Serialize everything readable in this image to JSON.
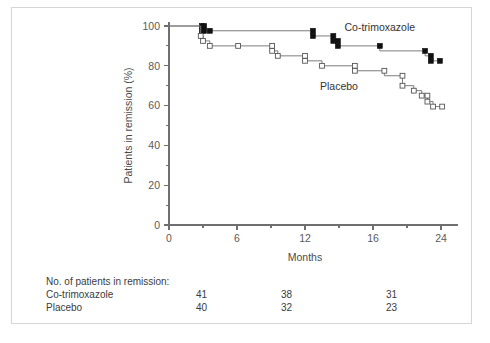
{
  "figure": {
    "background_color": "#ffffff",
    "frame_color": "#d6d6d6",
    "line_color": "#7d7d7d",
    "cotrimoxazole_marker_color": "#111111",
    "placebo_marker_color": "#ffffff",
    "placebo_marker_edge_color": "#555555"
  },
  "chart_data": {
    "type": "line",
    "title": "",
    "subtitle": "",
    "xlabel": "Months",
    "ylabel": "Patients in remission (%)",
    "xlim": [
      0,
      25.5
    ],
    "ylim": [
      0,
      100
    ],
    "xticks": [
      0,
      6,
      12,
      18,
      24
    ],
    "xtick_labels": [
      "0",
      "6",
      "12",
      "16",
      "24"
    ],
    "xminor_ticks": [
      3,
      9,
      15,
      21
    ],
    "yticks": [
      0,
      20,
      40,
      60,
      80,
      100
    ],
    "ytick_labels": [
      "0",
      "20",
      "40",
      "60",
      "80",
      "100"
    ],
    "yminor_ticks": [
      10,
      30,
      50,
      70,
      90
    ],
    "grid": false,
    "legend_position": "inline-annotation",
    "legend": [
      "Co-trimoxazole",
      "Placebo"
    ],
    "annotations": [
      {
        "text": "Co-trimoxazole",
        "x": 18.6,
        "y": 97.5
      },
      {
        "text": "Placebo",
        "x": 15.0,
        "y": 68.0
      }
    ],
    "series": [
      {
        "name": "Co-trimoxazole",
        "marker": "filled-square",
        "step": "post",
        "points": [
          {
            "x": 0.0,
            "y": 100.0
          },
          {
            "x": 2.9,
            "y": 100.0
          },
          {
            "x": 2.9,
            "y": 97.6
          },
          {
            "x": 3.1,
            "y": 97.6
          },
          {
            "x": 3.1,
            "y": 97.6
          },
          {
            "x": 3.6,
            "y": 97.6
          },
          {
            "x": 3.6,
            "y": 97.6
          },
          {
            "x": 12.7,
            "y": 97.6
          },
          {
            "x": 12.7,
            "y": 95.0
          },
          {
            "x": 14.5,
            "y": 95.0
          },
          {
            "x": 14.5,
            "y": 92.5
          },
          {
            "x": 14.9,
            "y": 92.5
          },
          {
            "x": 14.9,
            "y": 90.0
          },
          {
            "x": 18.6,
            "y": 90.0
          },
          {
            "x": 18.6,
            "y": 87.5
          },
          {
            "x": 22.6,
            "y": 87.5
          },
          {
            "x": 22.6,
            "y": 85.0
          },
          {
            "x": 23.1,
            "y": 85.0
          },
          {
            "x": 23.1,
            "y": 82.5
          },
          {
            "x": 23.9,
            "y": 82.5
          }
        ],
        "markers": [
          {
            "x": 2.9,
            "y": 100.0
          },
          {
            "x": 2.9,
            "y": 97.6
          },
          {
            "x": 3.1,
            "y": 100.0
          },
          {
            "x": 3.1,
            "y": 97.6
          },
          {
            "x": 3.6,
            "y": 97.6
          },
          {
            "x": 12.7,
            "y": 97.6
          },
          {
            "x": 12.7,
            "y": 95.0
          },
          {
            "x": 14.5,
            "y": 95.0
          },
          {
            "x": 14.5,
            "y": 92.5
          },
          {
            "x": 14.9,
            "y": 92.5
          },
          {
            "x": 14.9,
            "y": 90.0
          },
          {
            "x": 18.6,
            "y": 90.0
          },
          {
            "x": 22.6,
            "y": 87.5
          },
          {
            "x": 23.1,
            "y": 85.0
          },
          {
            "x": 23.1,
            "y": 82.5
          },
          {
            "x": 23.9,
            "y": 82.5
          }
        ]
      },
      {
        "name": "Placebo",
        "marker": "open-square",
        "step": "post",
        "points": [
          {
            "x": 0.0,
            "y": 100.0
          },
          {
            "x": 2.8,
            "y": 100.0
          },
          {
            "x": 2.8,
            "y": 95.0
          },
          {
            "x": 3.0,
            "y": 95.0
          },
          {
            "x": 3.0,
            "y": 92.5
          },
          {
            "x": 3.6,
            "y": 92.5
          },
          {
            "x": 3.6,
            "y": 90.0
          },
          {
            "x": 6.1,
            "y": 90.0
          },
          {
            "x": 6.1,
            "y": 90.0
          },
          {
            "x": 9.1,
            "y": 90.0
          },
          {
            "x": 9.1,
            "y": 87.5
          },
          {
            "x": 9.6,
            "y": 87.5
          },
          {
            "x": 9.6,
            "y": 85.0
          },
          {
            "x": 12.0,
            "y": 85.0
          },
          {
            "x": 12.0,
            "y": 82.5
          },
          {
            "x": 13.5,
            "y": 82.5
          },
          {
            "x": 13.5,
            "y": 80.0
          },
          {
            "x": 16.4,
            "y": 80.0
          },
          {
            "x": 16.4,
            "y": 77.5
          },
          {
            "x": 19.0,
            "y": 77.5
          },
          {
            "x": 19.0,
            "y": 75.0
          },
          {
            "x": 20.6,
            "y": 75.0
          },
          {
            "x": 20.6,
            "y": 70.0
          },
          {
            "x": 21.6,
            "y": 70.0
          },
          {
            "x": 21.6,
            "y": 67.5
          },
          {
            "x": 22.3,
            "y": 67.5
          },
          {
            "x": 22.3,
            "y": 65.0
          },
          {
            "x": 22.8,
            "y": 65.0
          },
          {
            "x": 22.8,
            "y": 62.0
          },
          {
            "x": 23.3,
            "y": 62.0
          },
          {
            "x": 23.3,
            "y": 59.5
          },
          {
            "x": 24.1,
            "y": 59.5
          }
        ],
        "markers": [
          {
            "x": 2.8,
            "y": 95.0
          },
          {
            "x": 3.0,
            "y": 92.5
          },
          {
            "x": 3.6,
            "y": 90.0
          },
          {
            "x": 6.1,
            "y": 90.0
          },
          {
            "x": 9.1,
            "y": 90.0
          },
          {
            "x": 9.1,
            "y": 87.5
          },
          {
            "x": 9.6,
            "y": 85.0
          },
          {
            "x": 12.0,
            "y": 85.0
          },
          {
            "x": 12.0,
            "y": 82.5
          },
          {
            "x": 13.5,
            "y": 80.0
          },
          {
            "x": 16.4,
            "y": 80.0
          },
          {
            "x": 16.4,
            "y": 77.5
          },
          {
            "x": 19.0,
            "y": 77.5
          },
          {
            "x": 20.6,
            "y": 75.0
          },
          {
            "x": 20.6,
            "y": 70.0
          },
          {
            "x": 21.6,
            "y": 67.5
          },
          {
            "x": 22.3,
            "y": 65.0
          },
          {
            "x": 22.8,
            "y": 65.0
          },
          {
            "x": 22.8,
            "y": 62.0
          },
          {
            "x": 23.3,
            "y": 59.5
          },
          {
            "x": 24.1,
            "y": 59.5
          }
        ]
      }
    ]
  },
  "risk_table": {
    "caption": "No. of patients in remission:",
    "rows": [
      {
        "label": "Co-trimoxazole",
        "values": [
          "41",
          "38",
          "31"
        ]
      },
      {
        "label": "Placebo",
        "values": [
          "40",
          "32",
          "23"
        ]
      }
    ]
  }
}
